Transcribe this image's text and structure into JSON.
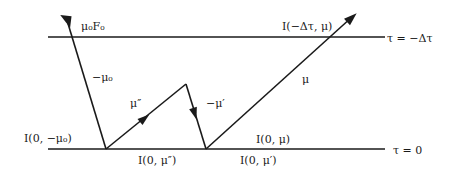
{
  "diagram": {
    "type": "radiative-transfer-layer",
    "boundaries": {
      "top": {
        "label": "τ = −Δτ"
      },
      "bottom": {
        "label": "τ = 0"
      }
    },
    "rays": {
      "incident": {
        "label": "−μ₀",
        "flux_label": "μ₀F₀"
      },
      "scattered_up": {
        "label": "μ″"
      },
      "scattered_down": {
        "label": "−μ′"
      },
      "emergent": {
        "label": "μ"
      }
    },
    "intensity_labels": {
      "top_exit": "I(−Δτ, μ)",
      "incident_bottom": "I(0, −μ₀)",
      "mu_double_prime": "I(0, μ″)",
      "mu": "I(0, μ)",
      "mu_prime": "I(0, μ′)"
    },
    "colors": {
      "line": "#1a1a1a",
      "background": "#ffffff"
    }
  }
}
